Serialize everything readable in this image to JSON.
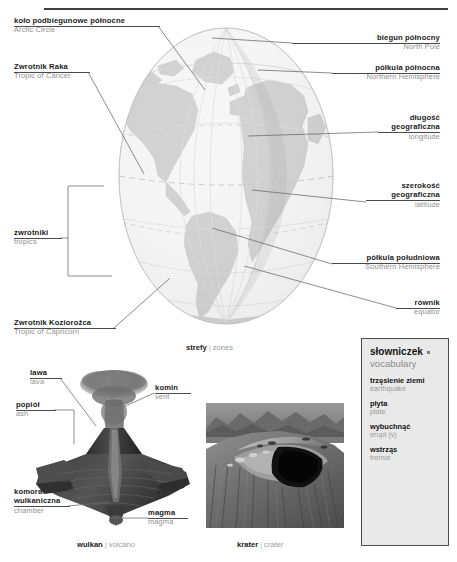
{
  "page": {
    "background": "#ffffff",
    "rule_color": "#3d3d3d",
    "pl_color": "#1b1b1b",
    "en_color": "#8e8e8e",
    "leader_color": "#6f6f6f"
  },
  "globe": {
    "caption_pl": "strefy",
    "caption_sep": "|",
    "caption_en": "zones",
    "ocean_color": "#f2f2f2",
    "land_color": "#b9b9b9",
    "grid_color": "#cfcfcf",
    "equator_color": "#b0b0b0",
    "labels": [
      {
        "id": "arctic-circle",
        "pl": "koło podbiegunowe północne",
        "en": "Arctic Circle",
        "align": "left"
      },
      {
        "id": "tropic-of-cancer",
        "pl": "Zwrotnik Raka",
        "en": "Tropic of Cancer",
        "align": "left"
      },
      {
        "id": "tropics",
        "pl": "zwrotniki",
        "en": "tropics",
        "align": "left"
      },
      {
        "id": "tropic-of-capricorn",
        "pl": "Zwrotnik Koziorożca",
        "en": "Tropic of Capricorn",
        "align": "left"
      },
      {
        "id": "north-pole",
        "pl": "biegun północny",
        "en": "North Pole",
        "align": "right"
      },
      {
        "id": "northern-hemisphere",
        "pl": "półkula północna",
        "en": "Northern Hemisphere",
        "align": "right"
      },
      {
        "id": "longitude",
        "pl": "długość\ngeograficzna",
        "en": "longitude",
        "align": "right"
      },
      {
        "id": "latitude",
        "pl": "szerokość\ngeograficzna",
        "en": "latitude",
        "align": "right"
      },
      {
        "id": "southern-hemisphere",
        "pl": "półkula południowa",
        "en": "Southern Hemisphere",
        "align": "right"
      },
      {
        "id": "equator",
        "pl": "równik",
        "en": "equator",
        "align": "right"
      }
    ]
  },
  "globe_labels": {
    "arctic_pl": "koło podbiegunowe północne",
    "arctic_en": "Arctic Circle",
    "cancer_pl": "Zwrotnik Raka",
    "cancer_en": "Tropic of Cancer",
    "tropics_pl": "zwrotniki",
    "tropics_en": "tropics",
    "capricorn_pl": "Zwrotnik Koziorożca",
    "capricorn_en": "Tropic of Capricorn",
    "northpole_pl": "biegun północny",
    "northpole_en": "North Pole",
    "northhemi_pl": "półkula północna",
    "northhemi_en": "Northern Hemisphere",
    "longitude_pl1": "długość",
    "longitude_pl2": "geograficzna",
    "longitude_en": "longitude",
    "latitude_pl1": "szerokość",
    "latitude_pl2": "geograficzna",
    "latitude_en": "latitude",
    "southhemi_pl": "półkula południowa",
    "southhemi_en": "Southern Hemisphere",
    "equator_pl": "równik",
    "equator_en": "equator"
  },
  "vocabulary": {
    "title": "słowniczek",
    "subtitle": "vocabulary",
    "entries": [
      {
        "pl": "trzęsienie ziemi",
        "en": "earthquake"
      },
      {
        "pl": "płyta",
        "en": "plate"
      },
      {
        "pl": "wybuchnąć",
        "en": "erupt (v)"
      },
      {
        "pl": "wstrząs",
        "en": "tremor"
      }
    ],
    "e0_pl": "trzęsienie ziemi",
    "e0_en": "earthquake",
    "e1_pl": "płyta",
    "e1_en": "plate",
    "e2_pl": "wybuchnąć",
    "e2_en": "erupt (v)",
    "e3_pl": "wstrząs",
    "e3_en": "tremor",
    "bg": "#e9e9e9",
    "border": "#4c4c4c"
  },
  "volcano": {
    "caption_pl": "wulkan",
    "caption_sep": "|",
    "caption_en": "volcano",
    "labels": {
      "lava_pl": "lawa",
      "lava_en": "lava",
      "vent_pl": "komin",
      "vent_en": "vent",
      "ash_pl": "popiół",
      "ash_en": "ash",
      "chamber_pl1": "komora",
      "chamber_pl2": "wulkaniczna",
      "chamber_en": "chamber",
      "magma_pl": "magma",
      "magma_en": "magma"
    }
  },
  "crater": {
    "caption_pl": "krater",
    "caption_sep": "|",
    "caption_en": "crater"
  }
}
